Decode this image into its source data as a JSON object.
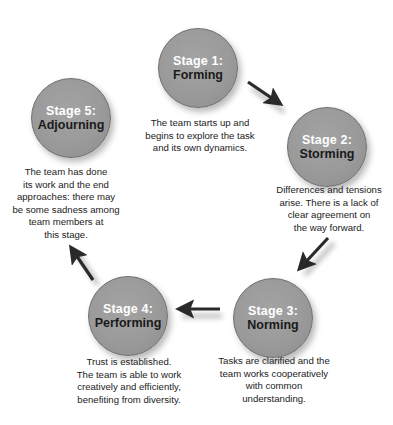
{
  "diagram": {
    "colors": {
      "circle_fill": "#9a9a9a",
      "stage_number_text": "#ffffff",
      "stage_name_text": "#1a1a1a",
      "description_text": "#222222",
      "arrow": "#2a2a2a"
    },
    "stages": [
      {
        "number": "Stage 1:",
        "name": "Forming",
        "description": [
          "The team starts up and",
          "begins to explore the task",
          "and its own dynamics."
        ]
      },
      {
        "number": "Stage 2:",
        "name": "Storming",
        "description": [
          "Differences and tensions",
          "arise. There is a lack of",
          "clear agreement on",
          "the way forward."
        ]
      },
      {
        "number": "Stage 3:",
        "name": "Norming",
        "description": [
          "Tasks are clarified and the",
          "team works cooperatively",
          "with common",
          "understanding."
        ]
      },
      {
        "number": "Stage 4:",
        "name": "Performing",
        "description": [
          "Trust is established.",
          "The team is able to work",
          "creatively and efficiently,",
          "benefiting from diversity."
        ]
      },
      {
        "number": "Stage 5:",
        "name": "Adjourning",
        "description": [
          "The team has done",
          "its work and the end",
          "approaches: there may",
          "be some sadness among",
          "team members at",
          "this stage."
        ]
      }
    ],
    "arrows": [
      {
        "from": "Stage 1",
        "to": "Stage 2",
        "icon": "arrow-down-right"
      },
      {
        "from": "Stage 2",
        "to": "Stage 3",
        "icon": "arrow-down-left"
      },
      {
        "from": "Stage 3",
        "to": "Stage 4",
        "icon": "arrow-left"
      },
      {
        "from": "Stage 4",
        "to": "Stage 5",
        "icon": "arrow-up-left"
      }
    ]
  }
}
